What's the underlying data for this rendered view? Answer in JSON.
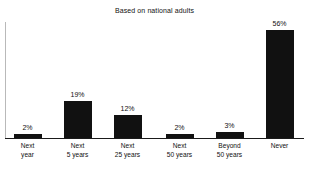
{
  "chart_data": {
    "type": "bar",
    "title": "Based on national adults",
    "subtitle": "",
    "xlabel": "",
    "ylabel": "",
    "ylim": [
      0,
      60
    ],
    "grid": false,
    "legend": false,
    "orientation": "vertical",
    "bar_color": "#111111",
    "axis_color": "#1a1a1a",
    "categories": [
      "Next year",
      "Next 5 years",
      "Next 25 years",
      "Next 50 years",
      "Beyond 50 years",
      "Never"
    ],
    "category_lines": [
      [
        "Next",
        "year"
      ],
      [
        "Next",
        "5 years"
      ],
      [
        "Next",
        "25 years"
      ],
      [
        "Next",
        "50 years"
      ],
      [
        "Beyond",
        "50 years"
      ],
      [
        "Never",
        ""
      ]
    ],
    "values": [
      2,
      19,
      12,
      2,
      3,
      56
    ],
    "value_labels": [
      "2%",
      "19%",
      "12%",
      "2%",
      "3%",
      "56%"
    ]
  },
  "chart": {
    "title": "Based on national adults",
    "bars": [
      {
        "value_label": "2%",
        "line1": "Next",
        "line2": "year"
      },
      {
        "value_label": "19%",
        "line1": "Next",
        "line2": "5 years"
      },
      {
        "value_label": "12%",
        "line1": "Next",
        "line2": "25 years"
      },
      {
        "value_label": "2%",
        "line1": "Next",
        "line2": "50 years"
      },
      {
        "value_label": "3%",
        "line1": "Beyond",
        "line2": "50 years"
      },
      {
        "value_label": "56%",
        "line1": "Never",
        "line2": ""
      }
    ]
  }
}
